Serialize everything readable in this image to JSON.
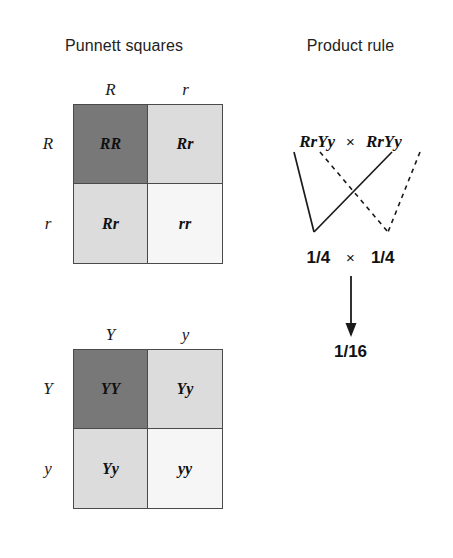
{
  "figure": {
    "background_color": "#ffffff",
    "text_color": "#1a1a1a"
  },
  "sections": {
    "punnett": {
      "title": "Punnett squares"
    },
    "product": {
      "title": "Product rule"
    }
  },
  "punnett_squares": [
    {
      "id": "seed-shape-square",
      "column_headers": [
        "R",
        "r"
      ],
      "row_headers": [
        "R",
        "r"
      ],
      "cells": [
        {
          "genotype": "RR",
          "shade": "dark",
          "color": "#787878"
        },
        {
          "genotype": "Rr",
          "shade": "light",
          "color": "#dcdcdc"
        },
        {
          "genotype": "Rr",
          "shade": "light",
          "color": "#dcdcdc"
        },
        {
          "genotype": "rr",
          "shade": "pale",
          "color": "#f6f6f6"
        }
      ]
    },
    {
      "id": "seed-color-square",
      "column_headers": [
        "Y",
        "y"
      ],
      "row_headers": [
        "Y",
        "y"
      ],
      "cells": [
        {
          "genotype": "YY",
          "shade": "dark",
          "color": "#787878"
        },
        {
          "genotype": "Yy",
          "shade": "light",
          "color": "#dcdcdc"
        },
        {
          "genotype": "Yy",
          "shade": "light",
          "color": "#dcdcdc"
        },
        {
          "genotype": "yy",
          "shade": "pale",
          "color": "#f6f6f6"
        }
      ]
    }
  ],
  "product_rule": {
    "parent_left": "RrYy",
    "parent_right": "RrYy",
    "cross_symbol": "×",
    "probability_left": "1/4",
    "probability_right": "1/4",
    "multiply_symbol": "×",
    "result": "1/16",
    "connector_styles": {
      "solid_description": "solid lines from R r alleles to left 1/4",
      "dashed_description": "dashed lines from Y y alleles to right 1/4",
      "line_color": "#1a1a1a"
    }
  }
}
